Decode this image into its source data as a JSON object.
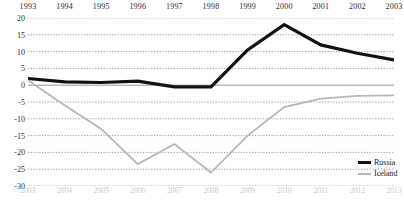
{
  "chart_data": {
    "type": "line",
    "title": "",
    "xlabel": "",
    "ylabel": "",
    "ylim": [
      -30,
      20
    ],
    "ytick_values": [
      20,
      15,
      10,
      5,
      0,
      -5,
      -10,
      -15,
      -20,
      -25,
      -30
    ],
    "ytick_labels": [
      "20",
      "15",
      "10",
      "5",
      "0",
      "-5",
      "-10",
      "-15",
      "-20",
      "-25",
      "-30"
    ],
    "grid": true,
    "legend_position": "bottom-right",
    "x_top_axis": {
      "label": "Russia years",
      "categories": [
        "1993",
        "1994",
        "1995",
        "1996",
        "1997",
        "1998",
        "1999",
        "2000",
        "2001",
        "2002",
        "2003"
      ]
    },
    "x_bottom_axis": {
      "label": "Iceland years",
      "categories": [
        "2003",
        "2004",
        "2005",
        "2006",
        "2007",
        "2008",
        "2009",
        "2010",
        "2011",
        "2012",
        "2013"
      ]
    },
    "series": [
      {
        "name": "Russia",
        "color": "#111111",
        "axis": "top",
        "x": [
          "1993",
          "1994",
          "1995",
          "1996",
          "1997",
          "1998",
          "1999",
          "2000",
          "2001",
          "2002",
          "2003"
        ],
        "values": [
          2.0,
          1.0,
          0.8,
          1.2,
          -0.5,
          -0.5,
          10.5,
          18.0,
          12.0,
          9.5,
          7.5
        ]
      },
      {
        "name": "Iceland",
        "color": "#b6b6b6",
        "axis": "bottom",
        "x": [
          "2003",
          "2004",
          "2005",
          "2006",
          "2007",
          "2008",
          "2009",
          "2010",
          "2011",
          "2012",
          "2013"
        ],
        "values": [
          1.5,
          -6.0,
          -13.0,
          -23.5,
          -17.5,
          -26.0,
          -15.0,
          -6.5,
          -4.0,
          -3.2,
          -3.0
        ]
      }
    ]
  },
  "legend": {
    "items": [
      {
        "label": "Russia"
      },
      {
        "label": "Iceland"
      }
    ]
  }
}
